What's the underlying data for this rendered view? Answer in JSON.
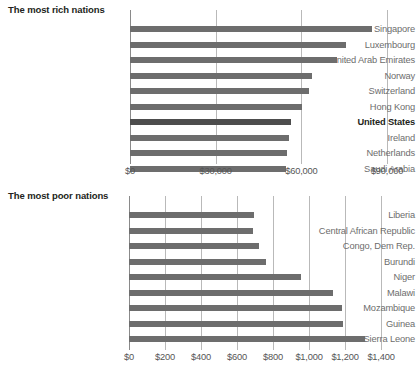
{
  "chart_data": [
    {
      "type": "bar",
      "orientation": "horizontal",
      "title": "The most rich nations",
      "xlabel": "",
      "ylabel": "",
      "xlim": [
        0,
        90000
      ],
      "xticks": [
        0,
        30000,
        60000,
        90000
      ],
      "xtick_labels": [
        "$0",
        "$30,000",
        "$60,000",
        "$90,000"
      ],
      "grid": true,
      "legend": "none",
      "bar_color": "#6d6d6d",
      "highlight_color": "#4d4d4d",
      "highlight_category": "United States",
      "categories": [
        "Singapore",
        "Luxembourg",
        "United Arab Emirates",
        "Norway",
        "Switzerland",
        "Hong Kong",
        "United States",
        "Ireland",
        "Netherlands",
        "Saudi Arabia"
      ],
      "values": [
        84900,
        75600,
        72500,
        63700,
        62700,
        60200,
        56400,
        55700,
        55000,
        54600
      ]
    },
    {
      "type": "bar",
      "orientation": "horizontal",
      "title": "The most poor nations",
      "xlabel": "",
      "ylabel": "",
      "xlim": [
        0,
        1400
      ],
      "xticks": [
        0,
        200,
        400,
        600,
        800,
        1000,
        1200,
        1400
      ],
      "xtick_labels": [
        "$0",
        "$200",
        "$400",
        "$600",
        "$800",
        "$1,000",
        "$1,200",
        "$1,400"
      ],
      "grid": true,
      "legend": "none",
      "bar_color": "#6d6d6d",
      "categories": [
        "Liberia",
        "Central African Republic",
        "Congo, Dem Rep.",
        "Burundi",
        "Niger",
        "Malawi",
        "Mozambique",
        "Guinea",
        "Sierra Leone"
      ],
      "values": [
        694,
        689,
        722,
        761,
        954,
        1132,
        1182,
        1187,
        1311
      ]
    }
  ],
  "layout": {
    "rich": {
      "plot_left": 130,
      "plot_right": 387,
      "first_row_top": 22,
      "row_step": 15.5,
      "bar_height": 6,
      "label_right_pad": 292,
      "axis_label_top": 166,
      "grid_top": 10,
      "grid_bottom": 164
    },
    "poor": {
      "plot_left": 129,
      "plot_right": 381,
      "first_row_top": 22,
      "row_step": 15.5,
      "bar_height": 6,
      "label_right_pad": 292,
      "axis_label_top": 166,
      "grid_top": 10,
      "grid_bottom": 164
    }
  }
}
